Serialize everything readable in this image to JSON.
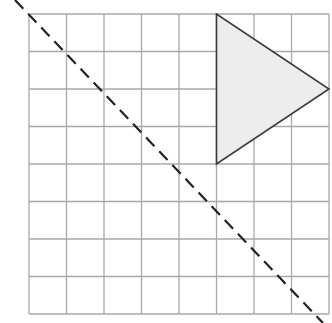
{
  "diagram": {
    "grid": {
      "columns": 8,
      "rows": 8,
      "origin_px": [
        29,
        14
      ],
      "cell_px": 37.5,
      "line_color": "#a8a8a8"
    },
    "triangle": {
      "vertices_grid": [
        [
          5,
          0
        ],
        [
          5,
          4
        ],
        [
          8,
          2
        ]
      ],
      "fill": "#ececec",
      "stroke": "#3a3a3a"
    },
    "dashed_line": {
      "from_px": [
        15,
        0
      ],
      "to_px": [
        323,
        323
      ],
      "color": "#222222",
      "label": "line of reflection"
    }
  }
}
